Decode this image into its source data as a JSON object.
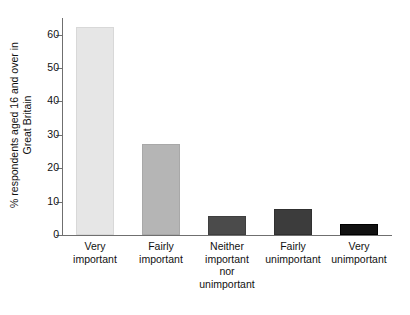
{
  "chart_data": {
    "type": "bar",
    "title": "",
    "subtitle": "",
    "xlabel": "",
    "ylabel_lines": [
      "% respondents aged 16 and over in",
      "Great Britain"
    ],
    "ylabel": "% respondents aged 16 and over in Great Britain",
    "categories": [
      "Very important",
      "Fairly important",
      "Neither important nor unimportant",
      "Fairly unimportant",
      "Very unimportant"
    ],
    "category_lines": [
      [
        "Very",
        "important"
      ],
      [
        "Fairly",
        "important"
      ],
      [
        "Neither",
        "important",
        "nor",
        "unimportant"
      ],
      [
        "Fairly",
        "unimportant"
      ],
      [
        "Very",
        "unimportant"
      ]
    ],
    "values": [
      62.2,
      27.3,
      5.8,
      7.8,
      3.2
    ],
    "bar_colors": [
      "#e6e6e6",
      "#b5b5b5",
      "#4b4b4b",
      "#3c3c3c",
      "#111111"
    ],
    "bar_border_colors": [
      "#d8d8d8",
      "#a8a8a8",
      "#3f3f3f",
      "#303030",
      "#000000"
    ],
    "ylim": [
      0,
      65
    ],
    "yticks": [
      0,
      10,
      20,
      30,
      40,
      50,
      60
    ],
    "ytick_labels": [
      "0",
      "10",
      "20",
      "30",
      "40",
      "50",
      "60"
    ],
    "grid": false,
    "legend": "none",
    "axis_color": "#6f6f6f"
  }
}
